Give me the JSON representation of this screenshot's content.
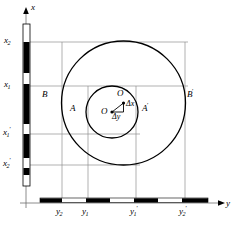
{
  "figure": {
    "background_color": "#ffffff",
    "stroke_color": "#000000",
    "guide_color": "#8c8c8c",
    "axes": {
      "x_axis_label": "x",
      "y_axis_label": "y",
      "origin_px": {
        "x": 26,
        "y": 203
      }
    },
    "x_scale_bar": {
      "orientation": "vertical",
      "x_px": 23,
      "top_px": 24,
      "bottom_px": 186,
      "width_px": 7,
      "segments": [
        {
          "fill": "white",
          "from_px": 24,
          "to_px": 42
        },
        {
          "fill": "black",
          "from_px": 42,
          "to_px": 73
        },
        {
          "fill": "white",
          "from_px": 73,
          "to_px": 84
        },
        {
          "fill": "black",
          "from_px": 84,
          "to_px": 124
        },
        {
          "fill": "white",
          "from_px": 124,
          "to_px": 134
        },
        {
          "fill": "black",
          "from_px": 134,
          "to_px": 158
        },
        {
          "fill": "white",
          "from_px": 158,
          "to_px": 168
        },
        {
          "fill": "black",
          "from_px": 168,
          "to_px": 175
        },
        {
          "fill": "white",
          "from_px": 175,
          "to_px": 186
        }
      ]
    },
    "y_scale_bar": {
      "orientation": "horizontal",
      "y_px": 200,
      "left_px": 40,
      "right_px": 208,
      "height_px": 4,
      "segments": [
        {
          "fill": "black",
          "from_px": 40,
          "to_px": 62
        },
        {
          "fill": "white",
          "from_px": 62,
          "to_px": 86
        },
        {
          "fill": "black",
          "from_px": 86,
          "to_px": 110
        },
        {
          "fill": "white",
          "from_px": 110,
          "to_px": 134
        },
        {
          "fill": "black",
          "from_px": 134,
          "to_px": 158
        },
        {
          "fill": "white",
          "from_px": 158,
          "to_px": 182
        },
        {
          "fill": "black",
          "from_px": 182,
          "to_px": 208
        }
      ]
    },
    "x_ticks": [
      {
        "id": "x2",
        "base": "x",
        "sub": "2",
        "prime": "",
        "y_px": 42,
        "label_x_px": 4,
        "label_y_px": 37
      },
      {
        "id": "x1",
        "base": "x",
        "sub": "1",
        "prime": "",
        "y_px": 86,
        "label_x_px": 4,
        "label_y_px": 81
      },
      {
        "id": "x1prime",
        "base": "x",
        "sub": "1",
        "prime": "′",
        "y_px": 134,
        "label_x_px": 3,
        "label_y_px": 129
      },
      {
        "id": "x2prime",
        "base": "x",
        "sub": "2",
        "prime": "′",
        "y_px": 165,
        "label_x_px": 3,
        "label_y_px": 160
      }
    ],
    "y_ticks": [
      {
        "id": "y2",
        "base": "y",
        "sub": "2",
        "prime": "",
        "x_px": 62,
        "label_x_px": 56,
        "label_y_px": 207
      },
      {
        "id": "y1",
        "base": "y",
        "sub": "1",
        "prime": "",
        "x_px": 88,
        "label_x_px": 82,
        "label_y_px": 207
      },
      {
        "id": "y1prime",
        "base": "y",
        "sub": "1",
        "prime": "′",
        "x_px": 136,
        "label_x_px": 130,
        "label_y_px": 207
      },
      {
        "id": "y2prime",
        "base": "y",
        "sub": "2",
        "prime": "′",
        "x_px": 185,
        "label_x_px": 179,
        "label_y_px": 207
      }
    ],
    "circles": [
      {
        "id": "outer-circle",
        "name": "outer circle B B'",
        "cx_px": 123.5,
        "cy_px": 103,
        "r_px": 62,
        "stroke_width": 1.3
      },
      {
        "id": "inner-circle",
        "name": "inner circle A A'",
        "cx_px": 112,
        "cy_px": 112,
        "r_px": 26,
        "stroke_width": 1.3
      }
    ],
    "points": [
      {
        "id": "O",
        "label": "O",
        "prime": "",
        "cx_px": 112,
        "cy_px": 112,
        "label_x_px": 102,
        "label_y_px": 108
      },
      {
        "id": "Oprime",
        "label": "O",
        "prime": "′",
        "cx_px": 123.5,
        "cy_px": 103,
        "label_x_px": 117,
        "label_y_px": 92
      }
    ],
    "delta_labels": [
      {
        "id": "delta-x",
        "text": "Δx",
        "x_px": 126,
        "y_px": 104
      },
      {
        "id": "delta-y",
        "text": "Δy",
        "x_px": 113,
        "y_px": 116
      }
    ],
    "point_labels": [
      {
        "id": "A",
        "base": "A",
        "prime": "",
        "x_px": 70,
        "y_px": 109
      },
      {
        "id": "Aprime",
        "base": "A",
        "prime": "′",
        "x_px": 142,
        "y_px": 109
      },
      {
        "id": "B",
        "base": "B",
        "prime": "",
        "x_px": 42,
        "y_px": 95
      },
      {
        "id": "Bprime",
        "base": "B",
        "prime": "′",
        "x_px": 187,
        "y_px": 95
      }
    ]
  }
}
